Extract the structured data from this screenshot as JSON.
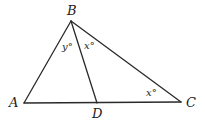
{
  "diagram": {
    "vertices": {
      "A": {
        "label": "A",
        "x": 24,
        "y": 103
      },
      "B": {
        "label": "B",
        "x": 71,
        "y": 21
      },
      "C": {
        "label": "C",
        "x": 181,
        "y": 102
      },
      "D": {
        "label": "D",
        "x": 97,
        "y": 103
      }
    },
    "segments": [
      {
        "from": "A",
        "to": "B"
      },
      {
        "from": "B",
        "to": "C"
      },
      {
        "from": "A",
        "to": "C"
      },
      {
        "from": "B",
        "to": "D"
      }
    ],
    "angle_labels": {
      "abd": {
        "text": "y°",
        "description": "angle ABD"
      },
      "dbc": {
        "text": "x°",
        "description": "angle DBC"
      },
      "bcd": {
        "text": "x°",
        "description": "angle BCD"
      }
    }
  }
}
